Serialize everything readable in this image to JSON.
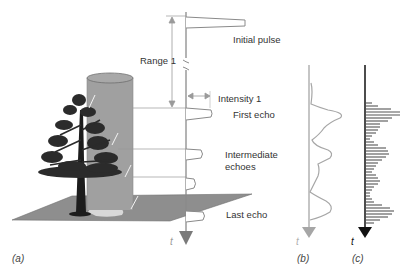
{
  "panel_a": {
    "caption": "(a)",
    "time_label": "t",
    "labels": {
      "initial_pulse": "Initial pulse",
      "range": "Range 1",
      "intensity": "Intensity 1",
      "first_echo": "First echo",
      "intermediate_line1": "Intermediate",
      "intermediate_line2": "echoes",
      "last_echo": "Last echo"
    }
  },
  "panel_b": {
    "caption": "(b)",
    "time_label": "t",
    "description": "continuous waveform"
  },
  "panel_c": {
    "caption": "(c)",
    "time_label": "t",
    "description": "discretized waveform"
  },
  "colors": {
    "axis_a": "#8a8a8a",
    "axis_b": "#9e9e9e",
    "axis_c": "#111111",
    "cylinder": "#9a9a9a",
    "ground": "#8c8c8c",
    "tree": "#2a2a2a",
    "text": "#333333"
  }
}
